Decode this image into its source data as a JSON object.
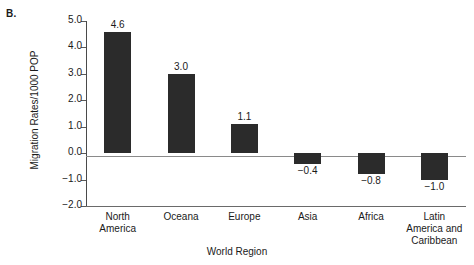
{
  "panel": {
    "letter": "B."
  },
  "chart_data": {
    "type": "bar",
    "title": "",
    "xlabel": "World Region",
    "ylabel": "Migration Rates/1000 POP",
    "categories": [
      "North\nAmerica",
      "Oceana",
      "Europe",
      "Asia",
      "Africa",
      "Latin\nAmerica and\nCaribbean"
    ],
    "category_lines": [
      [
        "North",
        "America"
      ],
      [
        "Oceana"
      ],
      [
        "Europe"
      ],
      [
        "Asia"
      ],
      [
        "Africa"
      ],
      [
        "Latin",
        "America and",
        "Caribbean"
      ]
    ],
    "values": [
      4.6,
      3.0,
      1.1,
      -0.4,
      -0.8,
      -1.0
    ],
    "value_labels": [
      "4.6",
      "3.0",
      "1.1",
      "−0.4",
      "−0.8",
      "−1.0"
    ],
    "ylim": [
      -2.0,
      5.0
    ],
    "ytick_values": [
      5.0,
      4.0,
      3.0,
      2.0,
      1.0,
      0.0,
      -1.0,
      -2.0
    ],
    "ytick_labels": [
      "5.0",
      "4.0",
      "3.0",
      "2.0",
      "1.0",
      "0.0",
      "−1.0",
      "−2.0"
    ],
    "grid": false,
    "legend": false,
    "bar_color": "#2b2b2b",
    "axis_color": "#4a4a4a",
    "zero_line_color": "#8a8a8a"
  }
}
